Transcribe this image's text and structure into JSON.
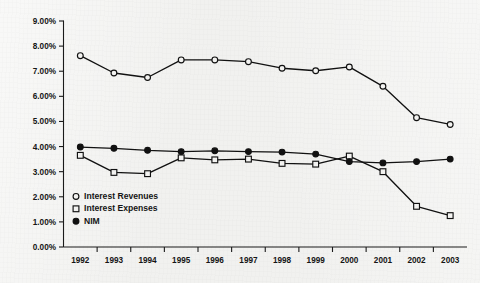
{
  "chart_data": {
    "type": "line",
    "title": "",
    "subtitle": "",
    "xlabel": "",
    "ylabel": "",
    "categories": [
      "1992",
      "1993",
      "1994",
      "1995",
      "1996",
      "1997",
      "1998",
      "1999",
      "2000",
      "2001",
      "2002",
      "2003"
    ],
    "ylim": [
      0,
      9
    ],
    "ytick_labels": [
      "0.00%",
      "1.00%",
      "2.00%",
      "3.00%",
      "4.00%",
      "5.00%",
      "6.00%",
      "7.00%",
      "8.00%",
      "9.00%"
    ],
    "ytick_values": [
      0,
      1,
      2,
      3,
      4,
      5,
      6,
      7,
      8,
      9
    ],
    "yaxis_unit": "%",
    "grid": false,
    "legend_position": "inside-bottom-left",
    "series": [
      {
        "name": "Interest Revenues",
        "marker": "open-circle",
        "color": "#111111",
        "values": [
          7.62,
          6.93,
          6.75,
          7.45,
          7.45,
          7.38,
          7.12,
          7.02,
          7.17,
          6.4,
          5.15,
          4.88
        ]
      },
      {
        "name": "Interest Expenses",
        "marker": "open-square",
        "color": "#111111",
        "values": [
          3.65,
          2.97,
          2.92,
          3.55,
          3.47,
          3.5,
          3.33,
          3.3,
          3.62,
          3.0,
          1.62,
          1.25
        ]
      },
      {
        "name": "NIM",
        "marker": "filled-circle",
        "color": "#111111",
        "values": [
          3.98,
          3.93,
          3.85,
          3.8,
          3.83,
          3.8,
          3.78,
          3.7,
          3.4,
          3.35,
          3.4,
          3.5
        ]
      }
    ]
  },
  "legend": {
    "items": [
      {
        "label": "Interest Revenues",
        "marker": "open-circle"
      },
      {
        "label": "Interest Expenses",
        "marker": "open-square"
      },
      {
        "label": "NIM",
        "marker": "filled-circle"
      }
    ]
  },
  "colors": {
    "background": "#f1f1ef",
    "ink": "#111111",
    "axis": "#1a1a1a"
  }
}
